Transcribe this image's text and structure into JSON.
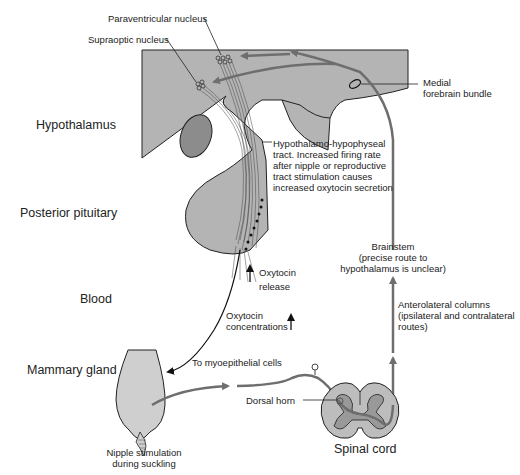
{
  "diagram": {
    "regions": {
      "hypothalamus": "Hypothalamus",
      "posterior_pituitary": "Posterior pituitary",
      "blood": "Blood",
      "mammary_gland": "Mammary gland",
      "spinal_cord": "Spinal cord"
    },
    "labels": {
      "paraventricular": "Paraventricular nucleus",
      "supraoptic": "Supraoptic nucleus",
      "mfb_line1": "Medial",
      "mfb_line2": "forebrain bundle",
      "tract_lines": [
        "Hypothalamo-hypophyseal",
        "tract. Increased firing rate",
        "after nipple or reproductive",
        "tract stimulation causes",
        "increased oxytocin secretion"
      ],
      "brainstem_lines": [
        "Brainstem",
        "(precise route to",
        "hypothalamus is unclear)"
      ],
      "anterolateral_lines": [
        "Anterolateral columns",
        "(ipsilateral and contralateral",
        "routes)"
      ],
      "oxytocin_release_lines": [
        "Oxytocin",
        "release"
      ],
      "oxytocin_conc_lines": [
        "Oxytocin",
        "concentrations"
      ],
      "myoepithelial": "To myoepithelial cells",
      "dorsal_horn": "Dorsal horn",
      "nipple_lines": [
        "Nipple stimulation",
        "during suckling"
      ]
    },
    "colors": {
      "hypothalamus_fill": "#b4b4b4",
      "nucleus_fill": "#8c8c8c",
      "pathway_stroke": "#6e6e6e",
      "spinal_outer": "#bdbdbd",
      "spinal_inner": "#999999",
      "gland_fill": "#cfcfcf"
    }
  }
}
